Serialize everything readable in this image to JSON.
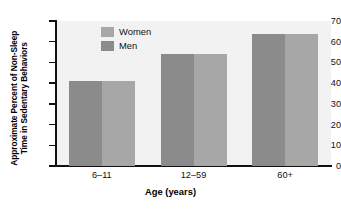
{
  "chart_data": {
    "type": "bar",
    "title": "",
    "subtitle": "",
    "xlabel": "Age (years)",
    "ylabel": "Approximate Percent of Non-Sleep\nTime in Sedentary Behaviors",
    "categories": [
      "6–11",
      "12–59",
      "60+"
    ],
    "series": [
      {
        "name": "Men",
        "values": [
          41,
          54,
          63.5
        ],
        "color": "#8b8b8b"
      },
      {
        "name": "Women",
        "values": [
          41,
          54,
          63.5
        ],
        "color": "#a7a7a7"
      }
    ],
    "ylim": [
      0,
      70
    ],
    "yticks": [
      0,
      10,
      20,
      30,
      40,
      50,
      60,
      70
    ],
    "ytick_labels": [
      "0",
      "10",
      "20",
      "30",
      "40",
      "50",
      "60",
      "70"
    ],
    "grid": false,
    "legend_position": "upper-left-inside",
    "plot_background": "#f2f2f2",
    "axis_color": "#111111",
    "figure_background": "#ffffff"
  },
  "legend": {
    "items": [
      {
        "label": "Women",
        "color": "#a7a7a7"
      },
      {
        "label": "Men",
        "color": "#8b8b8b"
      }
    ]
  }
}
